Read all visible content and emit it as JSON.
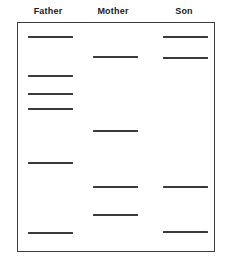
{
  "figure": {
    "box": {
      "x": 17,
      "y": 22,
      "width": 198,
      "height": 230
    }
  },
  "chart_data": {
    "type": "table",
    "xlabel": "",
    "ylabel": "",
    "categories": [
      "Father",
      "Mother",
      "Son"
    ],
    "axis_note": "Vertical position corresponds to DNA fragment migration distance",
    "grid": false,
    "legend": "none",
    "lanes": [
      {
        "label": "Father",
        "header_x": 48,
        "band_left": 28,
        "band_width": 45,
        "band_count": 6,
        "band_positions": [
          36,
          75,
          93,
          108,
          162,
          232
        ]
      },
      {
        "label": "Mother",
        "header_x": 113,
        "band_left": 93,
        "band_width": 45,
        "band_count": 4,
        "band_positions": [
          56,
          130,
          186,
          214
        ]
      },
      {
        "label": "Son",
        "header_x": 184,
        "band_left": 163,
        "band_width": 45,
        "band_count": 4,
        "band_positions": [
          36,
          57,
          186,
          231
        ]
      }
    ]
  },
  "colors": {
    "band": "#3a3a3a",
    "border": "#3c3c3c",
    "text": "#1a1a1a",
    "background": "#ffffff"
  }
}
